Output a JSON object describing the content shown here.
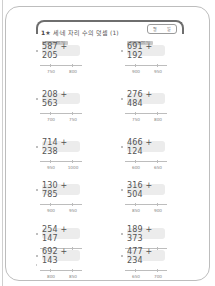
{
  "worksheet": {
    "title_number": "1",
    "title_marker": "★",
    "title_text": "세·네 자리 수의 덧셈 (1)",
    "date_month_label": "월",
    "date_day_label": "일",
    "tag_label": "받아올림이 한 번 있는"
  },
  "problems": [
    {
      "expression": "587 + 205",
      "line_left": "750",
      "line_right": "800",
      "has_tag": true
    },
    {
      "expression": "691 + 192",
      "line_left": "900",
      "line_right": "950",
      "has_tag": true
    },
    {
      "expression": "208 + 563",
      "line_left": "700",
      "line_right": "750",
      "has_tag": false
    },
    {
      "expression": "276 + 484",
      "line_left": "750",
      "line_right": "800",
      "has_tag": false
    },
    {
      "expression": "714 + 238",
      "line_left": "950",
      "line_right": "1000",
      "has_tag": false
    },
    {
      "expression": "466 + 124",
      "line_left": "600",
      "line_right": "650",
      "has_tag": false
    },
    {
      "expression": "130 + 785",
      "line_left": "900",
      "line_right": "950",
      "has_tag": false
    },
    {
      "expression": "316 + 504",
      "line_left": "850",
      "line_right": "900",
      "has_tag": false
    },
    {
      "expression": "254 + 147",
      "line_left": "400",
      "line_right": "450",
      "has_tag": false
    },
    {
      "expression": "189 + 373",
      "line_left": "550",
      "line_right": "600",
      "has_tag": false
    },
    {
      "expression": "692 + 143",
      "line_left": "800",
      "line_right": "850",
      "has_tag": false
    },
    {
      "expression": "477 + 234",
      "line_left": "650",
      "line_right": "700",
      "has_tag": false
    }
  ]
}
